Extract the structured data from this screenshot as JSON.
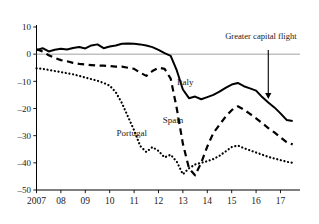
{
  "chart_data": {
    "type": "line",
    "title": "",
    "subtitle": "",
    "xlabel": "",
    "ylabel": "",
    "xlim": [
      2007,
      2017.8
    ],
    "ylim": [
      -50,
      10
    ],
    "ytick_values": [
      10,
      0,
      -10,
      -20,
      -30,
      -40,
      -50
    ],
    "ytick_labels": [
      "10",
      "0",
      "–10",
      "–20",
      "–30",
      "–40",
      "–50"
    ],
    "xtick_values": [
      2007,
      2008,
      2009,
      2010,
      2011,
      2012,
      2013,
      2014,
      2015,
      2016,
      2017
    ],
    "xtick_labels": [
      "2007",
      "08",
      "09",
      "10",
      "11",
      "12",
      "13",
      "14",
      "15",
      "16",
      "17"
    ],
    "grid": false,
    "zero_reference_line": true,
    "legend_position": "inline-labels",
    "series": [
      {
        "name": "Italy",
        "style": "solid",
        "label_x": 2013.1,
        "label_y": -11.5,
        "x": [
          2007.0,
          2007.25,
          2007.5,
          2007.75,
          2008.0,
          2008.25,
          2008.5,
          2008.75,
          2009.0,
          2009.25,
          2009.5,
          2009.75,
          2010.0,
          2010.25,
          2010.5,
          2010.75,
          2011.0,
          2011.25,
          2011.5,
          2011.75,
          2012.0,
          2012.25,
          2012.5,
          2012.75,
          2013.0,
          2013.25,
          2013.5,
          2013.75,
          2014.0,
          2014.25,
          2014.5,
          2014.75,
          2015.0,
          2015.25,
          2015.5,
          2015.75,
          2016.0,
          2016.25,
          2016.5,
          2016.75,
          2017.0,
          2017.25,
          2017.5
        ],
        "y": [
          1.5,
          2.2,
          1.0,
          1.6,
          2.0,
          1.7,
          2.3,
          2.6,
          2.1,
          3.2,
          3.6,
          2.2,
          2.8,
          3.2,
          3.8,
          3.9,
          3.8,
          3.6,
          3.2,
          2.6,
          1.6,
          0.4,
          -0.6,
          -6.0,
          -13.0,
          -16.2,
          -15.6,
          -16.6,
          -15.8,
          -15.0,
          -13.8,
          -12.4,
          -11.2,
          -10.6,
          -11.8,
          -12.6,
          -13.4,
          -15.8,
          -17.8,
          -19.6,
          -21.8,
          -24.2,
          -24.6
        ]
      },
      {
        "name": "Spain",
        "style": "dashed",
        "label_x": 2012.6,
        "label_y": -25.5,
        "x": [
          2007.0,
          2007.25,
          2007.5,
          2007.75,
          2008.0,
          2008.25,
          2008.5,
          2008.75,
          2009.0,
          2009.25,
          2009.5,
          2009.75,
          2010.0,
          2010.25,
          2010.5,
          2010.75,
          2011.0,
          2011.25,
          2011.5,
          2011.75,
          2012.0,
          2012.25,
          2012.5,
          2012.75,
          2013.0,
          2013.25,
          2013.5,
          2013.75,
          2014.0,
          2014.25,
          2014.5,
          2014.75,
          2015.0,
          2015.25,
          2015.5,
          2015.75,
          2016.0,
          2016.25,
          2016.5,
          2016.75,
          2017.0,
          2017.25,
          2017.5
        ],
        "y": [
          1.8,
          1.0,
          -0.4,
          -1.4,
          -2.2,
          -2.6,
          -3.2,
          -3.6,
          -3.8,
          -4.0,
          -4.2,
          -4.2,
          -4.4,
          -4.6,
          -4.6,
          -5.0,
          -5.4,
          -6.8,
          -8.0,
          -6.2,
          -5.0,
          -5.4,
          -9.0,
          -20.0,
          -33.0,
          -42.0,
          -44.6,
          -40.0,
          -34.0,
          -29.0,
          -26.0,
          -23.0,
          -20.6,
          -19.2,
          -20.4,
          -22.0,
          -23.6,
          -25.4,
          -27.2,
          -28.8,
          -30.6,
          -32.4,
          -33.2
        ]
      },
      {
        "name": "Portugal",
        "style": "dotted",
        "label_x": 2010.9,
        "label_y": -30.2,
        "x": [
          2007.0,
          2007.25,
          2007.5,
          2007.75,
          2008.0,
          2008.25,
          2008.5,
          2008.75,
          2009.0,
          2009.25,
          2009.5,
          2009.75,
          2010.0,
          2010.25,
          2010.5,
          2010.75,
          2011.0,
          2011.25,
          2011.5,
          2011.75,
          2012.0,
          2012.25,
          2012.5,
          2012.75,
          2013.0,
          2013.25,
          2013.5,
          2013.75,
          2014.0,
          2014.25,
          2014.5,
          2014.75,
          2015.0,
          2015.25,
          2015.5,
          2015.75,
          2016.0,
          2016.25,
          2016.5,
          2016.75,
          2017.0,
          2017.25,
          2017.5
        ],
        "y": [
          -5.2,
          -5.4,
          -5.8,
          -6.2,
          -6.6,
          -7.0,
          -7.4,
          -8.0,
          -8.6,
          -9.2,
          -9.8,
          -10.6,
          -11.6,
          -14.0,
          -18.0,
          -23.0,
          -28.0,
          -33.8,
          -36.0,
          -34.2,
          -35.6,
          -38.0,
          -37.0,
          -39.6,
          -44.2,
          -42.0,
          -40.6,
          -40.0,
          -39.4,
          -38.6,
          -37.4,
          -35.8,
          -34.2,
          -33.6,
          -34.6,
          -35.4,
          -36.2,
          -37.0,
          -37.8,
          -38.4,
          -39.0,
          -39.6,
          -40.0
        ]
      }
    ],
    "annotations": [
      {
        "text": "Greater capital flight",
        "x": 2016.2,
        "y": 5.6,
        "arrow": {
          "x": 2016.5,
          "y_from": 1.5,
          "y_to": -16.5,
          "direction": "down"
        }
      }
    ]
  }
}
